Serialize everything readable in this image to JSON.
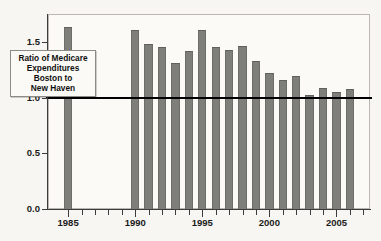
{
  "annotation": {
    "line1": "Ratio of Medicare",
    "line2": "Expenditures",
    "line3": "Boston to",
    "line4": "New Haven"
  },
  "chart_data": {
    "type": "bar",
    "title": "",
    "subtitle": "",
    "xlabel": "",
    "ylabel": "",
    "annotations": [
      "Ratio of Medicare Expenditures Boston to New Haven"
    ],
    "grid": false,
    "legend": "none",
    "bar_color": "#7e7e7a",
    "reference_line": {
      "value": 1.0,
      "color": "#000000",
      "label": ""
    },
    "xlim": [
      1984,
      2008
    ],
    "ylim": [
      0.0,
      1.75
    ],
    "y_ticks": [
      0.0,
      0.5,
      1.0,
      1.5
    ],
    "y_tick_labels": [
      "0.0",
      "0.5",
      "1.0",
      "1.5"
    ],
    "x_ticks": [
      1985,
      1986,
      1987,
      1988,
      1989,
      1990,
      1991,
      1992,
      1993,
      1994,
      1995,
      1996,
      1997,
      1998,
      1999,
      2000,
      2001,
      2002,
      2003,
      2004,
      2005,
      2006,
      2007
    ],
    "x_tick_labels": [
      "1985",
      "1990",
      "1995",
      "2000",
      "2005"
    ],
    "x_major_ticks": [
      1985,
      1990,
      1995,
      2000,
      2005
    ],
    "categories": [
      1985,
      1990,
      1991,
      1992,
      1993,
      1994,
      1995,
      1996,
      1997,
      1998,
      1999,
      2000,
      2001,
      2002,
      2003,
      2004,
      2005,
      2006
    ],
    "values": [
      1.63,
      1.61,
      1.48,
      1.45,
      1.31,
      1.42,
      1.61,
      1.45,
      1.43,
      1.46,
      1.33,
      1.22,
      1.16,
      1.19,
      1.02,
      1.09,
      1.05,
      1.08
    ],
    "missing_years": [
      1986,
      1987,
      1988,
      1989
    ]
  }
}
